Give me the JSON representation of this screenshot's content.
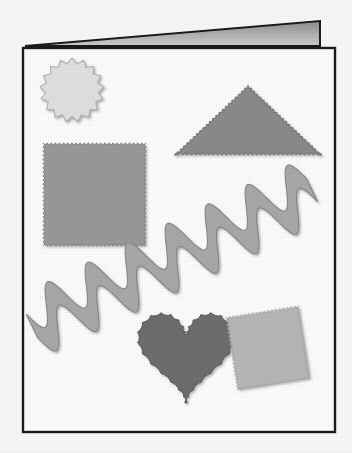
{
  "scene": {
    "title": "Greeting card with pinked-edge craft shapes",
    "background_color": "#fbfbfb",
    "width": 352,
    "height": 453
  },
  "card": {
    "name": "folded-greeting-card",
    "front_panel": {
      "label": "Card front panel",
      "fill": "#ffffff",
      "stroke": "#1b1b1b",
      "stroke_width": 2.2,
      "x": 23,
      "y": 48,
      "width": 312,
      "height": 384
    },
    "fold_flap": {
      "label": "Card back flap",
      "fill_top": "#8f9090",
      "fill_bottom": "#cfd0d0",
      "stroke": "#1b1b1b",
      "points": "25,46 320,21 320,46"
    }
  },
  "shapes": [
    {
      "id": "gear-circle",
      "label": "Scalloped circle",
      "edge": "pinked-scallop",
      "fill": "#e2e3e3",
      "stroke": "#b4b5b5",
      "cx": 72,
      "cy": 90,
      "radius": 32,
      "teeth": 17
    },
    {
      "id": "pinked-triangle",
      "label": "Pinked triangle",
      "edge": "pinked-zigzag",
      "fill": "#8b8c8c",
      "stroke": "#6f7070",
      "apex_x": 248,
      "apex_y": 85,
      "base_left_x": 174,
      "base_right_x": 322,
      "base_y": 155
    },
    {
      "id": "pinked-square",
      "label": "Pinked square",
      "edge": "pinked-zigzag",
      "fill": "#9a9b9b",
      "stroke": "#7d7e7e",
      "x": 43,
      "y": 143,
      "size": 103,
      "rotation": 0
    },
    {
      "id": "ric-rac-band",
      "label": "Ric-rac wave band",
      "edge": "smooth-wave",
      "fill": "#a9aaaa",
      "stroke": "#8a8b8b",
      "start_x": 32,
      "start_y": 326,
      "end_x": 312,
      "end_y": 190,
      "waves": 7,
      "band_width": 26
    },
    {
      "id": "scalloped-heart",
      "label": "Scalloped heart",
      "edge": "pinked-scallop",
      "fill": "#6e7070",
      "stroke": "#575858",
      "cx": 186,
      "cy": 350,
      "width": 98,
      "height": 100
    },
    {
      "id": "tilted-square",
      "label": "Tilted pinked square",
      "edge": "pinked-zigzag",
      "fill": "#b8b9b9",
      "stroke": "#9b9c9c",
      "x": 231,
      "y": 311,
      "size": 74,
      "rotation": -9
    }
  ]
}
